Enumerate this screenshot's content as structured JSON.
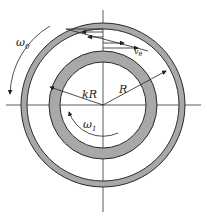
{
  "diagram": {
    "labels": {
      "omega_outer": "ω",
      "omega_outer_sub": "0",
      "omega_inner": "ω",
      "omega_inner_sub": "1",
      "velocity": "v",
      "velocity_sub": "θ",
      "inner_radius": "kR",
      "outer_radius": "R"
    },
    "colors": {
      "ring_fill": "#a8a8a8",
      "stroke": "#2a2a2a",
      "background": "#ffffff"
    },
    "geometry": {
      "center": [
        103,
        105
      ],
      "outer_ring": {
        "r_outer": 82,
        "r_inner": 76
      },
      "inner_ring": {
        "r_outer": 54,
        "r_inner": 43
      }
    }
  }
}
